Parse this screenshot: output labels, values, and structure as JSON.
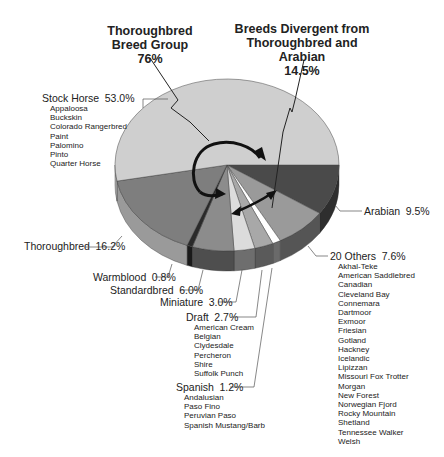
{
  "chart_data": {
    "type": "pie",
    "style": "3d-exploded-pie-grayscale",
    "groups": [
      {
        "title_line1": "Thoroughbred",
        "title_line2": "Breed Group",
        "value_label": "76%",
        "value": 76
      },
      {
        "title_line1": "Breeds Divergent from",
        "title_line2": "Thoroughbred and Arabian",
        "value_label": "14.5%",
        "value": 14.5
      }
    ],
    "slices": [
      {
        "name": "Arabian",
        "value": 9.5,
        "label": "9.5%",
        "color": "#4a4a4a",
        "side": "#2e2e2e",
        "breeds": []
      },
      {
        "name": "20 Others",
        "value": 7.6,
        "label": "7.6%",
        "color": "#9a9a9a",
        "side": "#555555",
        "breeds": [
          "Akhal-Teke",
          "American Saddlebred",
          "Canadian",
          "Cleveland Bay",
          "Connemara",
          "Dartmoor",
          "Exmoor",
          "Friesian",
          "Gotland",
          "Hackney",
          "Icelandic",
          "Lipizzan",
          "Missouri Fox Trotter",
          "Morgan",
          "New Forest",
          "Norwegian Fjord",
          "Rocky Mountain",
          "Shetland",
          "Tennessee Walker",
          "Welsh"
        ]
      },
      {
        "name": "Spanish",
        "value": 1.2,
        "label": "1.2%",
        "color": "#ffffff",
        "side": "#6a6a6a",
        "breeds": [
          "Andalusian",
          "Paso Fino",
          "Peruvian Paso",
          "Spanish Mustang/Barb"
        ]
      },
      {
        "name": "Draft",
        "value": 2.7,
        "label": "2.7%",
        "color": "#a8a8a8",
        "side": "#5a5a5a",
        "breeds": [
          "American Cream",
          "Belgian",
          "Clydesdale",
          "Percheron",
          "Shire",
          "Suffolk Punch"
        ]
      },
      {
        "name": "Miniature",
        "value": 3.0,
        "label": "3.0%",
        "color": "#dcdcdc",
        "side": "#6e6e6e",
        "breeds": []
      },
      {
        "name": "Standardbred",
        "value": 6.0,
        "label": "6.0%",
        "color": "#8c8c8c",
        "side": "#4e4e4e",
        "breeds": []
      },
      {
        "name": "Warmblood",
        "value": 0.8,
        "label": "0.8%",
        "color": "#2a2a2a",
        "side": "#1a1a1a",
        "breeds": []
      },
      {
        "name": "Thoroughbred",
        "value": 16.2,
        "label": "16.2%",
        "color": "#7e7e7e",
        "side": "#9a9a9a",
        "breeds": []
      },
      {
        "name": "Stock Horse",
        "value": 53.0,
        "label": "53.0%",
        "color": "#cfcfcf",
        "side": "#b0b0b0",
        "breeds": [
          "Appaloosa",
          "Buckskin",
          "Colorado Rangerbred",
          "Paint",
          "Palomino",
          "Pinto",
          "Quarter Horse"
        ]
      }
    ],
    "legend": "none (callout labels)",
    "start_angle_deg": 0,
    "direction": "clockwise"
  },
  "labels": {
    "stock": {
      "name": "Stock Horse",
      "pct": "53.0%"
    },
    "thoroughbred": {
      "name": "Thoroughbred",
      "pct": "16.2%"
    },
    "warmblood": {
      "name": "Warmblood",
      "pct": "0.8%"
    },
    "standardbred": {
      "name": "Standardbred",
      "pct": "6.0%"
    },
    "miniature": {
      "name": "Miniature",
      "pct": "3.0%"
    },
    "draft": {
      "name": "Draft",
      "pct": "2.7%"
    },
    "spanish": {
      "name": "Spanish",
      "pct": "1.2%"
    },
    "arabian": {
      "name": "Arabian",
      "pct": "9.5%"
    },
    "others": {
      "name": "20 Others",
      "pct": "7.6%"
    }
  }
}
